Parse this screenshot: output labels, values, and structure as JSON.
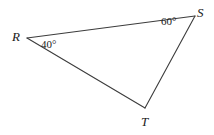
{
  "figure": {
    "kind": "triangle-geometry-diagram",
    "background_color": "#ffffff",
    "stroke_color": "#3c3c3c",
    "text_color": "#1a1a1a",
    "vertices": [
      {
        "name": "R",
        "label": "R",
        "x": 27,
        "y": 38,
        "label_x": 12,
        "label_y": 30
      },
      {
        "name": "S",
        "label": "S",
        "x": 195,
        "y": 16,
        "label_x": 197,
        "label_y": 6
      },
      {
        "name": "T",
        "label": "T",
        "x": 145,
        "y": 108,
        "label_x": 141,
        "label_y": 115
      }
    ],
    "sides": [
      {
        "name": "RS",
        "from": "R",
        "to": "S"
      },
      {
        "name": "ST",
        "from": "S",
        "to": "T"
      },
      {
        "name": "TR",
        "from": "T",
        "to": "R"
      }
    ],
    "angles": [
      {
        "at": "R",
        "label": "40°",
        "value": 40,
        "label_x": 41,
        "label_y": 39
      },
      {
        "at": "S",
        "label": "60°",
        "value": 60,
        "label_x": 161,
        "label_y": 16
      }
    ]
  }
}
